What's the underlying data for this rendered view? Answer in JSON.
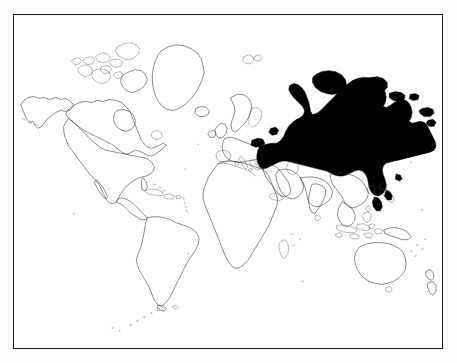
{
  "figure": {
    "type": "world-map",
    "projection": "equirectangular",
    "background_color": "#ffffff",
    "frame_color": "#1a1a1a",
    "coastline_color": "#2b2b2b",
    "highlight_color": "#000000",
    "legend": [],
    "labels": [],
    "visible_text": ""
  },
  "map": {
    "highlighted_regions": [
      {
        "name": "Russia",
        "fill": "#000000"
      }
    ],
    "outlined_regions": [
      {
        "name": "North America"
      },
      {
        "name": "Greenland"
      },
      {
        "name": "Canadian Arctic Archipelago"
      },
      {
        "name": "Iceland"
      },
      {
        "name": "South America"
      },
      {
        "name": "Europe"
      },
      {
        "name": "Scandinavia"
      },
      {
        "name": "British Isles"
      },
      {
        "name": "Africa"
      },
      {
        "name": "Madagascar"
      },
      {
        "name": "Arabian Peninsula"
      },
      {
        "name": "Middle East"
      },
      {
        "name": "India"
      },
      {
        "name": "Sri Lanka"
      },
      {
        "name": "China"
      },
      {
        "name": "Korean Peninsula"
      },
      {
        "name": "Japan"
      },
      {
        "name": "Southeast Asia"
      },
      {
        "name": "Indonesia"
      },
      {
        "name": "Philippines"
      },
      {
        "name": "New Guinea"
      },
      {
        "name": "Australia"
      },
      {
        "name": "New Zealand"
      },
      {
        "name": "Caribbean Islands"
      },
      {
        "name": "South Atlantic Islands"
      }
    ]
  }
}
